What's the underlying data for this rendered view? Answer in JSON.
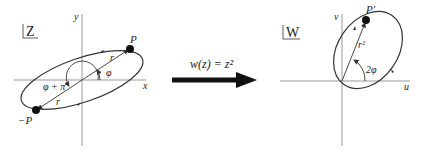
{
  "left_plane": {
    "plane_label": "Z",
    "x_axis_label": "x",
    "y_axis_label": "y",
    "point_label": "P",
    "neg_point_label": "−P",
    "radius_label_upper": "r",
    "radius_label_lower": "r",
    "angle_label": "φ",
    "angle_plus_pi_label": "φ + π"
  },
  "mapping": {
    "function_label": "w(z) = z²",
    "arrow_icon": "right-arrow"
  },
  "right_plane": {
    "plane_label": "W",
    "u_axis_label": "u",
    "v_axis_label": "v",
    "point_label": "P′",
    "radius_label": "r²",
    "angle_label": "2φ"
  },
  "colors": {
    "line": "#333333",
    "point": "#111111",
    "axis": "#888888"
  }
}
